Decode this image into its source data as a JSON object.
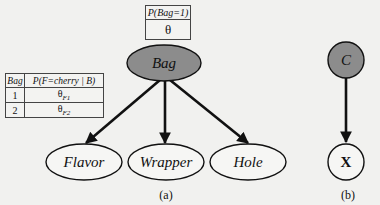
{
  "figure": {
    "panel_a": {
      "caption": "(a)",
      "root_node": {
        "label": "Bag",
        "fill": "#8c8c8c"
      },
      "child_nodes": [
        {
          "label": "Flavor"
        },
        {
          "label": "Wrapper"
        },
        {
          "label": "Hole"
        }
      ],
      "prior_table": {
        "header": "P(Bag=1)",
        "value": "θ"
      },
      "cpt_table": {
        "headers": [
          "Bag",
          "P(F=cherry | B)"
        ],
        "rows": [
          {
            "bag": "1",
            "theta": "θ",
            "sub": "F1"
          },
          {
            "bag": "2",
            "theta": "θ",
            "sub": "F2"
          }
        ]
      }
    },
    "panel_b": {
      "caption": "(b)",
      "parent_node": {
        "label": "C",
        "fill": "#8c8c8c"
      },
      "child_node": {
        "label": "X"
      }
    }
  }
}
